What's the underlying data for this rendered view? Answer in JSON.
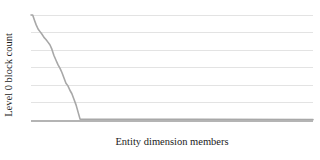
{
  "chart_data": {
    "type": "line",
    "title": "",
    "subtitle": "",
    "xlabel": "Entity dimension members",
    "ylabel": "Level 0 block count",
    "legend": [],
    "legend_position": "none",
    "grid": true,
    "grid_orientation": "horizontal",
    "grid_line_count": 6,
    "x_tick_labels": [],
    "y_tick_labels": [],
    "xlim": [
      0,
      100
    ],
    "ylim": [
      0,
      6
    ],
    "series": [
      {
        "name": "Level 0 block count",
        "color": "#a8a8a8",
        "x": [
          0.0,
          0.6,
          1.2,
          1.8,
          2.5,
          3.2,
          3.9,
          4.6,
          5.3,
          6.0,
          6.7,
          7.4,
          8.1,
          8.9,
          9.6,
          10.3,
          11.0,
          11.7,
          12.4,
          13.1,
          13.8,
          14.5,
          15.2,
          16.0,
          16.7,
          17.4,
          100.0
        ],
        "values": [
          6.0,
          6.0,
          5.72,
          5.45,
          5.2,
          5.05,
          4.9,
          4.72,
          4.6,
          4.45,
          4.3,
          4.05,
          3.7,
          3.4,
          3.15,
          2.95,
          2.7,
          2.4,
          2.1,
          1.95,
          1.7,
          1.5,
          1.2,
          0.85,
          0.45,
          0.05,
          0.02
        ]
      }
    ]
  }
}
